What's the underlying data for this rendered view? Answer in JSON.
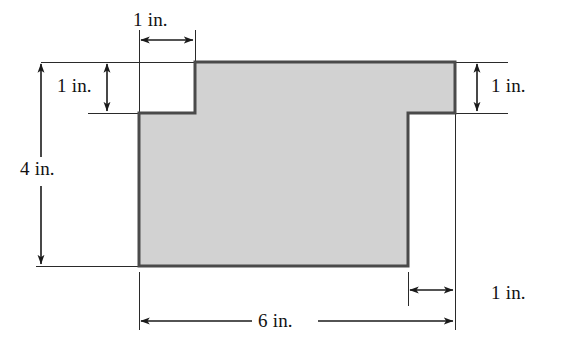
{
  "figure": {
    "kind": "composite-rectilinear-polygon",
    "units": "inches",
    "fill_color": "#d2d2d2",
    "stroke_color": "#4a4a4a",
    "dimension_line_color": "#1a1a1a",
    "background_color": "#ffffff",
    "dimensions": {
      "top_notch_width": "1 in.",
      "top_notch_depth": "1 in.",
      "overall_height": "4 in.",
      "right_notch_depth": "1 in.",
      "right_notch_width": "1 in.",
      "overall_width": "6 in."
    },
    "labels": {
      "top_1in": "1 in.",
      "left_1in": "1 in.",
      "left_4in": "4 in.",
      "right_1in": "1 in.",
      "bottom_right_1in": "1 in.",
      "bottom_6in": "6 in."
    },
    "geometry": {
      "outline_points_px": "195,62 455,62 455,113 408,113 408,266 139,266 139,113 195,113",
      "main_left_x": 139,
      "main_right_x": 455,
      "main_top_y": 62,
      "main_bottom_y": 266,
      "top_notch_right_x": 195,
      "top_notch_bottom_y": 113,
      "right_notch_left_x": 408,
      "right_notch_top_y": 113
    }
  }
}
